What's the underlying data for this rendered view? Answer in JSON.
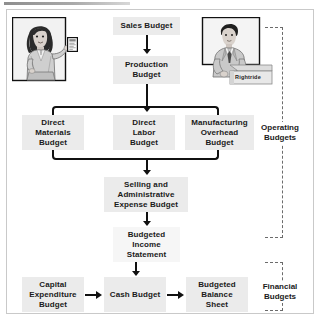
{
  "diagram": {
    "title_rule": "",
    "boxes": {
      "sales": "Sales Budget",
      "production": "Production\nBudget",
      "direct_materials": "Direct\nMaterials\nBudget",
      "direct_labor": "Direct\nLabor\nBudget",
      "manufacturing_overhead": "Manufacturing\nOverhead\nBudget",
      "selling_admin": "Selling and\nAdministrative\nExpense Budget",
      "budgeted_income": "Budgeted\nIncome\nStatement",
      "capital_expenditure": "Capital\nExpenditure\nBudget",
      "cash": "Cash Budget",
      "budgeted_balance": "Budgeted\nBalance\nSheet"
    },
    "group_labels": {
      "operating": "Operating\nBudgets",
      "financial": "Financial\nBudgets"
    },
    "illustrations": {
      "presenter": "woman-presenting-chart",
      "salesman": "man-at-counter",
      "counter_sign": "Rightride"
    },
    "colors": {
      "box_fill": "#ebebeb",
      "connector": "#111111",
      "frame_border": "#c9c9c9",
      "dashed_bracket": "#6b6b6b",
      "text": "#1a1a1a"
    }
  }
}
